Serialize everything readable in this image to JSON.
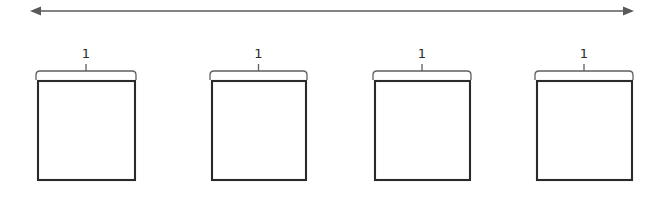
{
  "figure": {
    "type": "geometry-diagram",
    "background_color": "#ffffff",
    "width": 662,
    "height": 200,
    "span_arrow": {
      "name": "total-length-arrow",
      "orientation": "horizontal",
      "double_headed": true,
      "x_start": 30,
      "x_end": 634,
      "y": 11,
      "color": "#5a5a5a",
      "label": ""
    },
    "boxes": [
      {
        "id": "box-1",
        "label": "1",
        "x": 38,
        "y": 81,
        "width": 97,
        "height": 99,
        "fill": "#ffffff",
        "stroke": "#2a2a2a",
        "brace": {
          "x_start": 36,
          "x_end": 136,
          "y": 71,
          "label_y": 58,
          "color": "#5f5f5f"
        }
      },
      {
        "id": "box-2",
        "label": "1",
        "x": 212,
        "y": 81,
        "width": 94,
        "height": 99,
        "fill": "#ffffff",
        "stroke": "#2a2a2a",
        "brace": {
          "x_start": 210,
          "x_end": 307,
          "y": 71,
          "label_y": 58,
          "color": "#5f5f5f"
        }
      },
      {
        "id": "box-3",
        "label": "1",
        "x": 375,
        "y": 81,
        "width": 95,
        "height": 99,
        "fill": "#ffffff",
        "stroke": "#2a2a2a",
        "brace": {
          "x_start": 373,
          "x_end": 471,
          "y": 71,
          "label_y": 58,
          "color": "#5f5f5f"
        }
      },
      {
        "id": "box-4",
        "label": "1",
        "x": 537,
        "y": 81,
        "width": 95,
        "height": 99,
        "fill": "#ffffff",
        "stroke": "#2a2a2a",
        "brace": {
          "x_start": 535,
          "x_end": 633,
          "y": 71,
          "label_y": 58,
          "color": "#5f5f5f"
        }
      }
    ]
  }
}
